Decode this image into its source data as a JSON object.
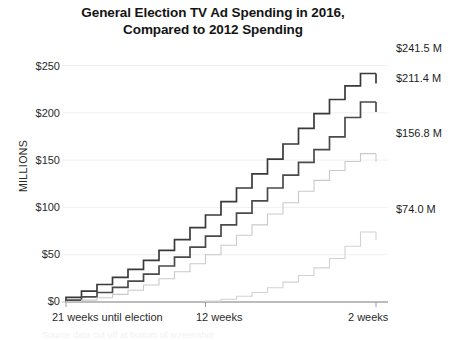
{
  "chart_data": {
    "type": "line",
    "title": "General Election TV Ad Spending in 2016, Compared  to 2012 Spending",
    "title_line1": "General Election TV Ad Spending in 2016,",
    "title_line2": "Compared  to 2012 Spending",
    "xlabel": "",
    "ylabel": "MILLIONS",
    "ylim": [
      0,
      260
    ],
    "yticks": [
      0,
      50,
      100,
      150,
      200,
      250
    ],
    "ytick_labels": [
      "$0",
      "$50",
      "$100",
      "$150",
      "$200",
      "$250"
    ],
    "grid": true,
    "legend_position": "none",
    "x": [
      21,
      20,
      19,
      18,
      17,
      16,
      15,
      14,
      13,
      12,
      11,
      10,
      9,
      8,
      7,
      6,
      5,
      4,
      3,
      2
    ],
    "x_note": "weeks until election, counting down left to right",
    "xticks": [
      21,
      12,
      2
    ],
    "xtick_labels": [
      "21 weeks until election",
      "12 weeks",
      "2 weeks"
    ],
    "step_style": "post",
    "series": [
      {
        "name": "series-1-darkest",
        "color": "#3a3a3a",
        "end_value": 241.5,
        "end_label": "$241.5 M",
        "values": [
          5.0,
          11.5,
          18.5,
          26.0,
          34.5,
          44.0,
          54.5,
          66.0,
          78.5,
          92.0,
          106.0,
          120.5,
          135.5,
          151.0,
          167.0,
          183.5,
          199.0,
          214.0,
          228.5,
          241.5
        ]
      },
      {
        "name": "series-2-dark",
        "color": "#4a4a4a",
        "end_value": 211.4,
        "end_label": "$211.4 M",
        "values": [
          2.0,
          5.5,
          10.0,
          15.5,
          22.0,
          29.5,
          38.0,
          47.5,
          58.0,
          69.5,
          81.5,
          94.0,
          107.0,
          120.5,
          134.0,
          147.5,
          161.0,
          174.5,
          195.0,
          211.4
        ]
      },
      {
        "name": "series-3-light",
        "color": "#c9c9c9",
        "end_value": 156.8,
        "end_label": "$156.8 M",
        "values": [
          0.5,
          2.0,
          4.5,
          8.0,
          12.5,
          18.0,
          24.5,
          32.0,
          40.5,
          50.0,
          60.0,
          70.5,
          81.5,
          93.0,
          105.0,
          117.0,
          128.5,
          139.0,
          148.5,
          156.8
        ]
      },
      {
        "name": "series-4-lightest",
        "color": "#d2d2d2",
        "end_value": 74.0,
        "end_label": "$74.0 M",
        "values": [
          0,
          0,
          0,
          0,
          0,
          0,
          0,
          0,
          0,
          1.0,
          3.0,
          6.0,
          10.0,
          15.0,
          21.0,
          28.0,
          36.0,
          46.0,
          59.0,
          74.0
        ]
      }
    ],
    "end_labels": [
      {
        "text": "$241.5 M",
        "value": 241.5
      },
      {
        "text": "$211.4 M",
        "value": 211.4
      },
      {
        "text": "$156.8 M",
        "value": 156.8
      },
      {
        "text": "$74.0 M",
        "value": 74.0
      }
    ]
  },
  "footer": {
    "cutoff_text": "Source data cut off at bottom of screenshot"
  }
}
